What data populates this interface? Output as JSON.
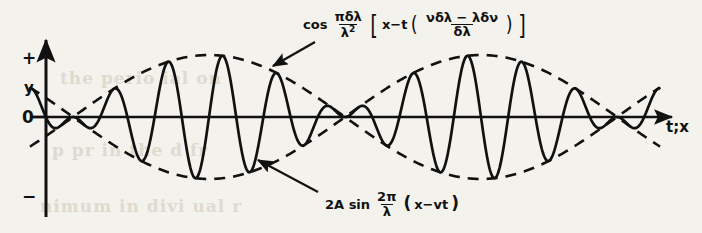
{
  "figure": {
    "name": "beats-wave-packet-diagram",
    "background_color": "#f4f2ec",
    "ink_color": "#111111",
    "ghost_color": "#d8d3c6"
  },
  "axes": {
    "x_axis_label": "t;x",
    "y_axis_ticks": [
      "+",
      "y",
      "0",
      "−"
    ],
    "y_tick_plus": "+",
    "y_tick_y": "y",
    "y_tick_zero": "0",
    "y_tick_minus": "−"
  },
  "annotations": {
    "envelope": {
      "target": "dashed-envelope-curve",
      "prefix": "cos",
      "frac_num": "πδλ",
      "frac_den_base": "λ",
      "frac_den_exp": "2",
      "bracket_open": "[",
      "body_left": "x−t",
      "paren_open": "(",
      "inner_num": "νδλ − λδν",
      "inner_den": "δλ",
      "paren_close": ")",
      "bracket_close": "]",
      "plain_text": "cos (πδλ/λ²)[x−t((νδλ−λδν)/δλ)]"
    },
    "carrier": {
      "target": "solid-carrier-wave",
      "prefix": "2A sin",
      "frac_num": "2π",
      "frac_den": "λ",
      "paren_open": "(",
      "body": "x−vt",
      "paren_close": ")",
      "plain_text": "2A sin (2π/λ)(x−vt)"
    }
  },
  "ghost_text": {
    "line1": "the   perio   ial   on",
    "line2": "p   pr   in   the   d   fr",
    "line3": "nimum   in   divi   ual   r"
  },
  "chart_data": {
    "type": "line",
    "title": "",
    "xlabel": "t;x",
    "ylabel": "y",
    "xlim": [
      0,
      660
    ],
    "ylim": [
      -1.08,
      1.08
    ],
    "grid": false,
    "legend": "annotated arrows",
    "axis_origin_px": {
      "x": 46,
      "y": 117
    },
    "amplitude_px": 62,
    "beat_nodes_px": [
      73,
      345,
      617
    ],
    "beat_period_px": 272,
    "carrier_period_px": 54.4,
    "carrier_cycles_per_beat": 5,
    "series": [
      {
        "name": "2A sin (2π/λ)(x−vt)",
        "style": "solid",
        "role": "carrier",
        "description": "fast oscillation whose amplitude is modulated by the envelope"
      },
      {
        "name": "cos (πδλ/λ²)[x−t((νδλ−λδν)/δλ)]",
        "style": "dashed",
        "role": "envelope-upper",
        "description": "slow modulating cosine envelope, upper branch"
      },
      {
        "name": "−cos (πδλ/λ²)[x−t((νδλ−λδν)/δλ)]",
        "style": "dashed",
        "role": "envelope-lower",
        "description": "slow modulating cosine envelope, lower branch (mirror)"
      }
    ]
  }
}
